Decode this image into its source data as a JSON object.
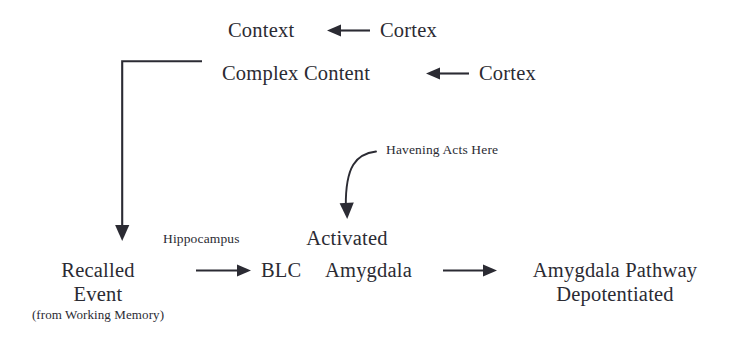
{
  "diagram": {
    "ink_color": "#2b2b33",
    "background_color": "#ffffff",
    "nodes": {
      "context": "Context",
      "cortex_top": "Cortex",
      "complex_content": "Complex Content",
      "cortex_second": "Cortex",
      "hippocampus_label": "Hippocampus",
      "havening_label": "Havening Acts Here",
      "activated": "Activated",
      "recalled": "Recalled",
      "event": "Event",
      "working_memory": "(from Working Memory)",
      "blc": "BLC",
      "amygdala": "Amygdala",
      "pathway_line1": "Amygdala Pathway",
      "pathway_line2": "Depotentiated"
    },
    "arrows": [
      {
        "name": "cortex-to-context",
        "direction": "left",
        "label": ""
      },
      {
        "name": "cortex-to-complex-content",
        "direction": "left",
        "label": ""
      },
      {
        "name": "complex-content-to-recalled-event",
        "direction": "down",
        "label": ""
      },
      {
        "name": "havening-to-activated-amygdala",
        "direction": "curved-down",
        "label": "Havening Acts Here"
      },
      {
        "name": "recalled-event-to-blc",
        "direction": "right",
        "label": "Hippocampus"
      },
      {
        "name": "amygdala-to-pathway",
        "direction": "right",
        "label": ""
      }
    ]
  }
}
